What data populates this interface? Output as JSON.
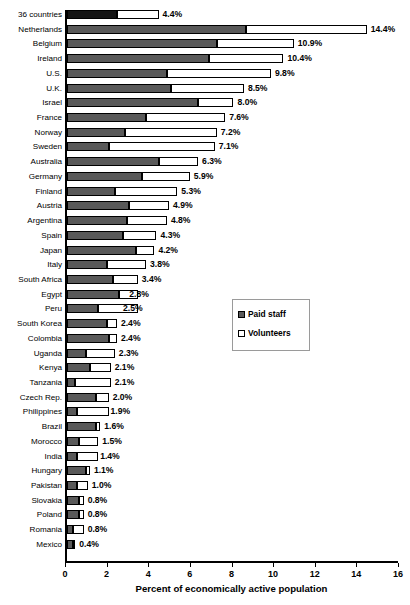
{
  "chart_data": {
    "type": "bar",
    "orientation": "horizontal",
    "stacked": true,
    "title": "",
    "xlabel": "Percent of economically active population",
    "ylabel": "",
    "xlim": [
      0,
      16
    ],
    "xticks": [
      0,
      2,
      4,
      6,
      8,
      10,
      12,
      14,
      16
    ],
    "grid": false,
    "legend_position": "middle-right",
    "legend": [
      "Paid staff",
      "Volunteers"
    ],
    "series": [
      {
        "name": "Paid staff",
        "color": "#595959",
        "values": [
          2.4,
          8.6,
          7.2,
          6.8,
          4.8,
          5.0,
          6.3,
          3.8,
          2.8,
          2.0,
          4.4,
          3.6,
          2.3,
          3.0,
          2.9,
          2.7,
          3.3,
          1.9,
          2.2,
          2.5,
          1.5,
          1.9,
          2.0,
          0.9,
          1.1,
          0.4,
          1.4,
          0.5,
          1.4,
          0.6,
          0.5,
          0.9,
          0.5,
          0.6,
          0.6,
          0.3,
          0.3
        ]
      },
      {
        "name": "Volunteers",
        "color": "#ffffff",
        "values": [
          2.0,
          5.8,
          3.7,
          3.6,
          5.0,
          3.5,
          1.7,
          3.8,
          4.4,
          5.1,
          1.9,
          2.3,
          3.0,
          1.9,
          1.9,
          1.6,
          0.9,
          1.9,
          1.2,
          0.9,
          1.9,
          0.5,
          0.4,
          1.4,
          1.0,
          1.7,
          0.6,
          1.5,
          0.2,
          0.9,
          1.0,
          0.2,
          0.5,
          0.2,
          0.2,
          0.5,
          0.1
        ]
      }
    ],
    "categories": [
      "36 countries",
      "Netherlands",
      "Belgium",
      "Ireland",
      "U.S.",
      "U.K.",
      "Israel",
      "France",
      "Norway",
      "Sweden",
      "Australia",
      "Germany",
      "Finland",
      "Austria",
      "Argentina",
      "Spain",
      "Japan",
      "Italy",
      "South Africa",
      "Egypt",
      "Peru",
      "South Korea",
      "Colombia",
      "Uganda",
      "Kenya",
      "Tanzania",
      "Czech Rep.",
      "Philippines",
      "Brazil",
      "Morocco",
      "India",
      "Hungary",
      "Pakistan",
      "Slovakia",
      "Poland",
      "Romania",
      "Mexico"
    ],
    "totals": [
      4.4,
      14.4,
      10.9,
      10.4,
      9.8,
      8.5,
      8.0,
      7.6,
      7.2,
      7.1,
      6.3,
      5.9,
      5.3,
      4.9,
      4.8,
      4.3,
      4.2,
      3.8,
      3.4,
      2.8,
      2.5,
      2.4,
      2.4,
      2.3,
      2.1,
      2.1,
      2.0,
      1.9,
      1.6,
      1.5,
      1.4,
      1.1,
      1.0,
      0.8,
      0.8,
      0.8,
      0.4
    ],
    "data_labels": [
      "4.4%",
      "14.4%",
      "10.9%",
      "10.4%",
      "9.8%",
      "8.5%",
      "8.0%",
      "7.6%",
      "7.2%",
      "7.1%",
      "6.3%",
      "5.9%",
      "5.3%",
      "4.9%",
      "4.8%",
      "4.3%",
      "4.2%",
      "3.8%",
      "3.4%",
      "2.8%",
      "2.5%",
      "2.4%",
      "2.4%",
      "2.3%",
      "2.1%",
      "2.1%",
      "2.0%",
      "1.9%",
      "1.6%",
      "1.5%",
      "1.4%",
      "1.1%",
      "1.0%",
      "0.8%",
      "0.8%",
      "0.8%",
      "0.4%"
    ],
    "xtick_labels": [
      "0",
      "2",
      "4",
      "6",
      "8",
      "10",
      "12",
      "14",
      "16"
    ],
    "colors": {
      "paid_staff": "#595959",
      "paid_staff_highlight": "#141414",
      "volunteers": "#ffffff",
      "outline": "#000000"
    }
  }
}
